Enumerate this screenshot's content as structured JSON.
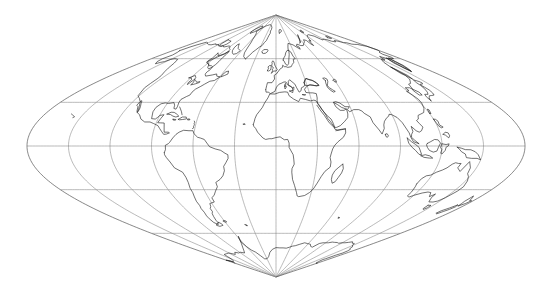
{
  "figure": {
    "type": "map",
    "background_color": "#ffffff",
    "coastline_color": "#1a1a1a",
    "graticule_color": "#8c8c8c",
    "outline_color": "#555555"
  },
  "projection": {
    "name": "sinusoidal",
    "central_meridian_deg": 0,
    "center_x_px": 276,
    "center_y_px": 146,
    "half_width_px": 249,
    "half_height_px": 131,
    "north_pole_y_px": 15,
    "south_pole_y_px": 277,
    "left_edge_x_px": 27,
    "right_edge_x_px": 525
  },
  "graticule": {
    "meridian_interval_deg": 30,
    "parallel_interval_deg": 30,
    "meridians_deg": [
      -180,
      -150,
      -120,
      -90,
      -60,
      -30,
      0,
      30,
      60,
      90,
      120,
      150,
      180
    ],
    "parallels_deg": [
      -60,
      -30,
      0,
      30,
      60
    ],
    "parallel_y_px": {
      "60N": 59,
      "30N": 102,
      "0": 146,
      "30S": 190,
      "60S": 233
    },
    "show_grid": true,
    "show_outline": true
  },
  "map_content": {
    "landmasses": [
      "North America",
      "South America",
      "Europe",
      "Africa",
      "Asia",
      "Australia",
      "Antarctica",
      "Greenland",
      "Indonesia",
      "Japan",
      "New Zealand",
      "British Isles",
      "Madagascar",
      "Iceland"
    ],
    "features": [
      "Mediterranean Sea",
      "Black Sea",
      "Red Sea",
      "Caspian Sea",
      "Hudson Bay",
      "Gulf of Mexico",
      "Caribbean islands",
      "Arabian Peninsula",
      "Indian subcontinent",
      "Scandinavia",
      "Alaska",
      "Antarctic Peninsula"
    ]
  },
  "labels": {
    "has_axis_labels": false,
    "has_legend": false,
    "has_title_text": false,
    "tick_labels": []
  }
}
